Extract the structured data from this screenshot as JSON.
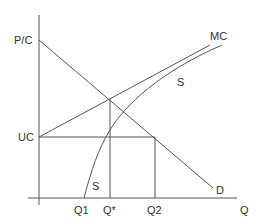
{
  "diagram": {
    "type": "economics supply-demand diagram",
    "axes": {
      "y_label": "P/C",
      "x_label": "Q"
    },
    "curves": {
      "marginal_cost": "MC",
      "supply_upper": "S",
      "supply_lower": "S",
      "demand": "D"
    },
    "levels": {
      "unit_cost": "UC"
    },
    "quantities": {
      "q1": "Q1",
      "q_star": "Q*",
      "q2": "Q2"
    },
    "colors": {
      "line": "#555555",
      "text": "#333333",
      "background": "#ffffff"
    }
  }
}
